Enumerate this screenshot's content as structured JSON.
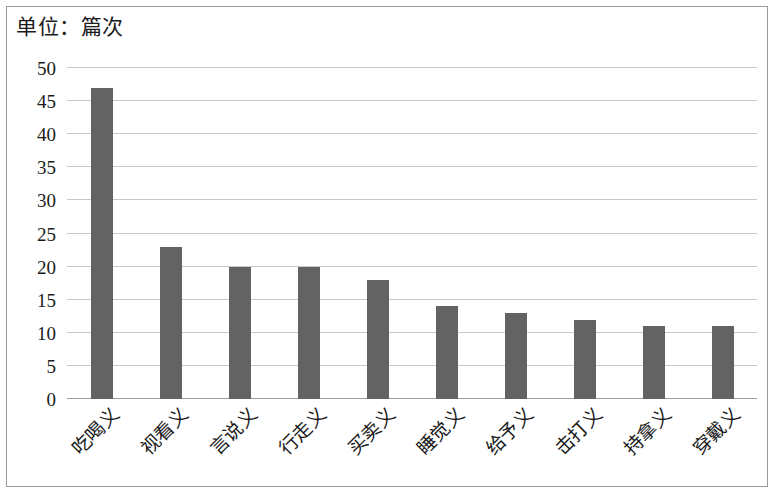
{
  "chart_data": {
    "type": "bar",
    "title": "单位：篇次",
    "xlabel": "",
    "ylabel": "",
    "categories": [
      "吃喝义",
      "视看义",
      "言说义",
      "行走义",
      "买卖义",
      "睡觉义",
      "给予义",
      "击打义",
      "持拿义",
      "穿戴义"
    ],
    "values": [
      47,
      23,
      20,
      20,
      18,
      14,
      13,
      12,
      11,
      11
    ],
    "ylim": [
      0,
      50
    ],
    "ytick_labels": [
      "50",
      "45",
      "40",
      "35",
      "30",
      "25",
      "20",
      "15",
      "10",
      "5",
      "0"
    ],
    "ytick_values": [
      50,
      45,
      40,
      35,
      30,
      25,
      20,
      15,
      10,
      5,
      0
    ],
    "grid": true,
    "legend": false,
    "bar_color": "#636363",
    "grid_color": "#c8c8c8",
    "axis_color": "#9e9e9e",
    "background_color": "#ffffff",
    "text_color": "#1a1a1a",
    "border_color": "#9a9a9a",
    "xtick_rotation": -45
  }
}
